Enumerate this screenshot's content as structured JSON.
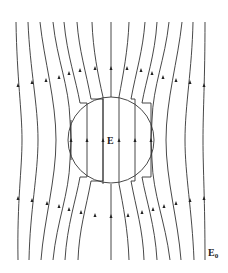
{
  "diagram": {
    "labels": {
      "inner_field": "E",
      "outer_field": "E",
      "outer_field_subscript": "0"
    },
    "colors": {
      "line": "#333333",
      "background": "#ffffff"
    },
    "sphere": {
      "cx": 111,
      "cy": 140,
      "r": 43
    },
    "field_direction": "up"
  }
}
